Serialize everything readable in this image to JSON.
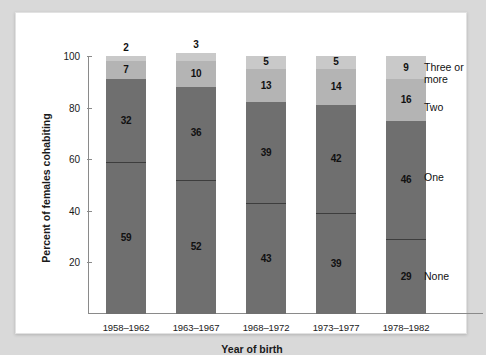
{
  "chart_data": {
    "type": "bar",
    "subtype": "stacked-100-percent",
    "title": "",
    "xlabel": "Year of birth",
    "ylabel": "Percent of females cohabiting",
    "ylim": [
      0,
      100
    ],
    "yticks": [
      20,
      40,
      60,
      80,
      100
    ],
    "grid": false,
    "legend_position": "right-of-last-bar",
    "categories": [
      "1958–1962",
      "1963–1967",
      "1968–1972",
      "1973–1977",
      "1978–1982"
    ],
    "series": [
      {
        "name": "None",
        "color": "#6f6f6f",
        "values": [
          59,
          52,
          43,
          39,
          29
        ]
      },
      {
        "name": "One",
        "color": "#6f6f6f",
        "values": [
          32,
          36,
          39,
          42,
          46
        ]
      },
      {
        "name": "Two",
        "color": "#b4b4b4",
        "values": [
          7,
          10,
          13,
          14,
          16
        ]
      },
      {
        "name": "Three or more",
        "color": "#c9c9c9",
        "values": [
          2,
          3,
          5,
          5,
          9
        ]
      }
    ],
    "label_placement": {
      "Three or more": [
        "outside",
        "outside",
        "inside",
        "inside",
        "inside"
      ]
    },
    "annotations": []
  },
  "axis": {
    "y_tick_labels": [
      "20",
      "40",
      "60",
      "80",
      "100"
    ],
    "y_title": "Percent of females cohabiting",
    "x_title": "Year of birth"
  },
  "series_labels": {
    "three_or_more": "Three or\nmore",
    "two": "Two",
    "one": "One",
    "none": "None"
  }
}
